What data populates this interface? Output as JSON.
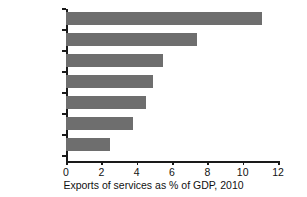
{
  "chart_data": {
    "type": "bar",
    "orientation": "horizontal",
    "title": "",
    "xlabel": "Exports of services as % of GDP, 2010",
    "ylabel": "",
    "xlim": [
      0,
      12
    ],
    "xticks": [
      "0",
      "2",
      "4",
      "6",
      "8",
      "10",
      "12"
    ],
    "xtick_values": [
      0,
      2,
      4,
      6,
      8,
      10,
      12
    ],
    "grid": false,
    "legend": null,
    "bar_color": "#6e6e6e",
    "axis_color": "#1a1a1a",
    "categories": [
      "UK",
      "Germany",
      "France",
      "Italy",
      "Canada",
      "US",
      "Japan"
    ],
    "values": [
      11.1,
      7.4,
      5.5,
      4.9,
      4.5,
      3.8,
      2.5
    ],
    "bars": [
      {
        "label": "UK",
        "value": 11.1
      },
      {
        "label": "Germany",
        "value": 7.4
      },
      {
        "label": "France",
        "value": 5.5
      },
      {
        "label": "Italy",
        "value": 4.9
      },
      {
        "label": "Canada",
        "value": 4.5
      },
      {
        "label": "US",
        "value": 3.8
      },
      {
        "label": "Japan",
        "value": 2.5
      }
    ]
  }
}
